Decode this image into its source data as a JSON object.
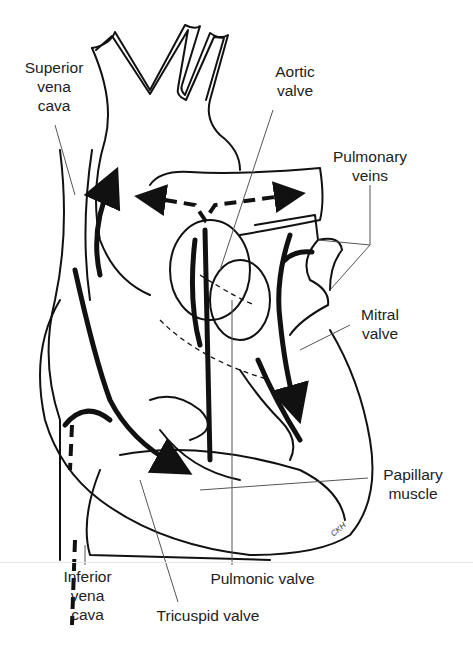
{
  "figure": {
    "signature": "CKH",
    "labels": {
      "superior_vena_cava": "Superior\nvena\ncava",
      "aortic_valve": "Aortic\nvalve",
      "pulmonary_veins": "Pulmonary\nveins",
      "mitral_valve": "Mitral\nvalve",
      "papillary_muscle": "Papillary\nmuscle",
      "inferior_vena_cava": "Inferior\nvena\ncava",
      "pulmonic_valve": "Pulmonic valve",
      "tricuspid_valve": "Tricuspid valve"
    },
    "colors": {
      "ink": "#111111",
      "leader": "#555555",
      "background": "#ffffff"
    }
  }
}
